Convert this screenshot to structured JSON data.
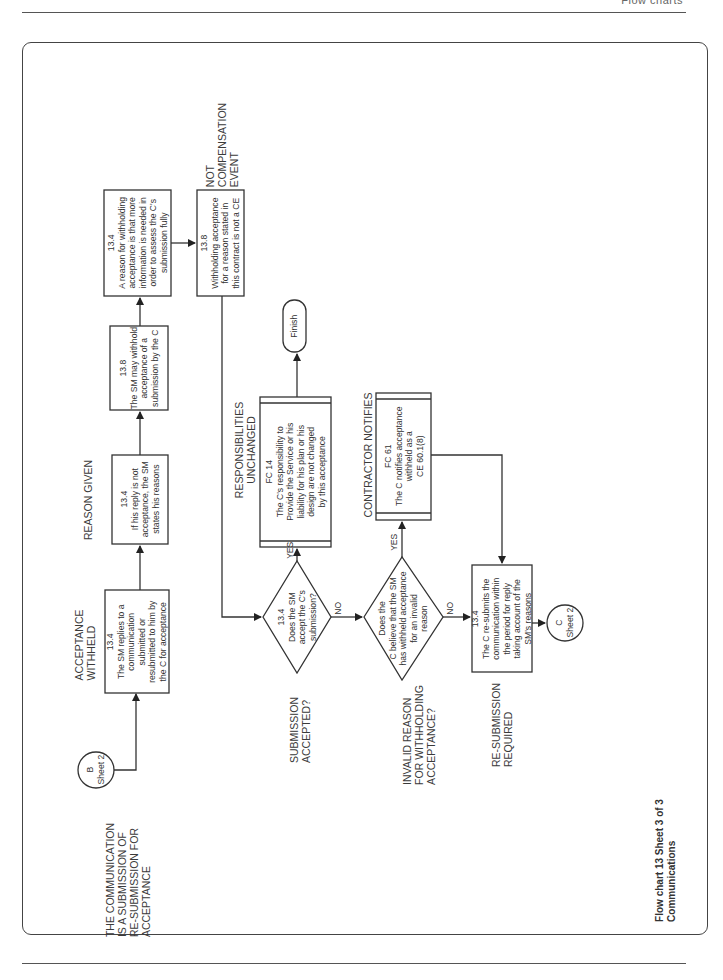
{
  "page": {
    "header_text": "Flow charts",
    "caption_line1": "Flow chart 13  Sheet 3 of 3",
    "caption_line2": "Communications"
  },
  "connectors": {
    "b": {
      "letter": "B",
      "sheet": "Sheet 2"
    },
    "c": {
      "letter": "C",
      "sheet": "Sheet 2"
    }
  },
  "stage_labels": {
    "communication": [
      "THE COMMUNICATION",
      "IS A SUBMISSION OF",
      "RE-SUBMISSION FOR",
      "ACCEPTANCE"
    ],
    "acceptance_withheld": [
      "ACCEPTANCE",
      "WITHHELD"
    ],
    "reason_given": [
      "REASON GIVEN"
    ],
    "not_compensation": [
      "NOT",
      "COMPENSATION",
      "EVENT"
    ],
    "submission_accepted": [
      "SUBMISSION",
      "ACCEPTED?"
    ],
    "responsibilities": [
      "RESPONSIBILITIES",
      "UNCHANGED"
    ],
    "invalid_reason": [
      "INVALID REASON",
      "FOR WITHHOLDING",
      "ACCEPTANCE?"
    ],
    "contractor_notifies": [
      "CONTRACTOR NOTIFIES"
    ],
    "resubmission": [
      "RE-SUBMISSION",
      "REQUIRED"
    ]
  },
  "boxes": {
    "sm_replies": {
      "clause": "13.4",
      "lines": [
        "The SM replies to a",
        "communication",
        "submitted or",
        "resubmitted to him by",
        "the C for acceptance"
      ]
    },
    "reason_given": {
      "clause": "13.4",
      "lines": [
        "If his reply is not",
        "acceptance, the SM",
        "states his reasons"
      ]
    },
    "may_withhold": {
      "clause": "13.8",
      "lines": [
        "The SM may withhold",
        "acceptance of a",
        "submission by the C"
      ]
    },
    "more_info": {
      "clause": "13.4",
      "lines": [
        "A reason for withholding",
        "acceptance is that more",
        "information is needed in",
        "order to assess the C's",
        "submission fully"
      ]
    },
    "not_ce": {
      "clause": "13.8",
      "lines": [
        "Withholding acceptance",
        "for a reason stated in",
        "this contract is not a CE"
      ]
    },
    "fc14": {
      "clause": "FC 14",
      "lines": [
        "The C's responsibility to",
        "Provide the Service or his",
        "liability for his plan or his",
        "design are not changed",
        "by this acceptance"
      ]
    },
    "fc61": {
      "clause": "FC 61",
      "lines": [
        "The C notifies acceptance",
        "withheld as a",
        "CE 60.1(8)"
      ]
    },
    "resubmit": {
      "clause": "13.4",
      "lines": [
        "The C re-submits the",
        "communication within",
        "the period for reply",
        "taking account of the",
        "SM's reasons"
      ]
    }
  },
  "decisions": {
    "accept": {
      "clause": "13.4",
      "lines": [
        "Does the SM",
        "accept the C's",
        "submission?"
      ],
      "yes": "YES",
      "no": "NO"
    },
    "invalid": {
      "lines": [
        "Does the",
        "C believe that the SM",
        "has withheld acceptance",
        "for an invalid",
        "reason"
      ],
      "yes": "YES",
      "no": "NO"
    }
  },
  "terminal": {
    "finish": "Finish"
  }
}
